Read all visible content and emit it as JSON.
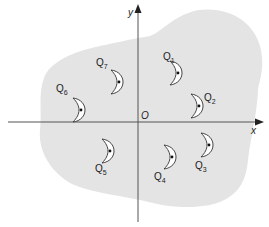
{
  "figure": {
    "region_fill": "#e4e4e4",
    "axis_color": "#555555",
    "crescent_fill": "#ffffff",
    "crescent_stroke": "#333333",
    "axes": {
      "x_label": "x",
      "y_label": "y",
      "origin_label": "O"
    },
    "crescents": [
      {
        "name": "Q",
        "sub": "1",
        "cx": 176,
        "cy": 73,
        "lx": 163,
        "ly": 60
      },
      {
        "name": "Q",
        "sub": "2",
        "cx": 197,
        "cy": 106,
        "lx": 204,
        "ly": 101
      },
      {
        "name": "Q",
        "sub": "3",
        "cx": 207,
        "cy": 145,
        "lx": 195,
        "ly": 169
      },
      {
        "name": "Q",
        "sub": "4",
        "cx": 170,
        "cy": 157,
        "lx": 154,
        "ly": 180
      },
      {
        "name": "Q",
        "sub": "5",
        "cx": 108,
        "cy": 151,
        "lx": 95,
        "ly": 172
      },
      {
        "name": "Q",
        "sub": "6",
        "cx": 79,
        "cy": 110,
        "lx": 56,
        "ly": 92
      },
      {
        "name": "Q",
        "sub": "7",
        "cx": 117,
        "cy": 82,
        "lx": 96,
        "ly": 66
      }
    ]
  }
}
